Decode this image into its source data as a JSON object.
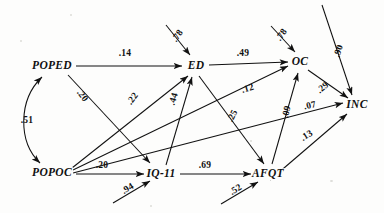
{
  "diagram": {
    "type": "path-analysis-diagram",
    "title": "",
    "nodes": [
      {
        "id": "POPED",
        "label": "POPED",
        "x": 52,
        "y": 66
      },
      {
        "id": "POPOC",
        "label": "POPOC",
        "x": 52,
        "y": 173
      },
      {
        "id": "ED",
        "label": "ED",
        "x": 196,
        "y": 66
      },
      {
        "id": "IQ11",
        "label": "IQ-11",
        "x": 161,
        "y": 174
      },
      {
        "id": "OC",
        "label": "OC",
        "x": 300,
        "y": 62
      },
      {
        "id": "AFQT",
        "label": "AFQT",
        "x": 268,
        "y": 174
      },
      {
        "id": "INC",
        "label": "INC",
        "x": 357,
        "y": 105
      }
    ],
    "edges": [
      {
        "from": "POPED",
        "to": "ED",
        "coef": ".14",
        "lx": 125,
        "ly": 54,
        "rot": 0
      },
      {
        "from": "POPED",
        "to": "IQ11",
        "coef": ".20",
        "lx": 82,
        "ly": 96,
        "rot": 52
      },
      {
        "from": "POPOC",
        "to": "ED",
        "coef": ".22",
        "lx": 133,
        "ly": 99,
        "rot": -52
      },
      {
        "from": "POPOC",
        "to": "OC",
        "coef": ".12",
        "lx": 248,
        "ly": 89,
        "rot": -16
      },
      {
        "from": "POPOC",
        "to": "INC",
        "coef": ".07",
        "lx": 310,
        "ly": 106,
        "rot": -13
      },
      {
        "from": "POPOC",
        "to": "IQ11",
        "coef": ".20",
        "lx": 102,
        "ly": 166,
        "rot": 0
      },
      {
        "from": "IQ11",
        "to": "ED",
        "coef": ".44",
        "lx": 174,
        "ly": 99,
        "rot": -73
      },
      {
        "from": "IQ11",
        "to": "AFQT",
        "coef": ".69",
        "lx": 205,
        "ly": 166,
        "rot": 0
      },
      {
        "from": "ED",
        "to": "OC",
        "coef": ".49",
        "lx": 243,
        "ly": 54,
        "rot": 0
      },
      {
        "from": "ED",
        "to": "AFQT",
        "coef": ".25",
        "lx": 233,
        "ly": 116,
        "rot": -63
      },
      {
        "from": "AFQT",
        "to": "OC",
        "coef": ".09",
        "lx": 287,
        "ly": 112,
        "rot": -78
      },
      {
        "from": "AFQT",
        "to": "INC",
        "coef": ".13",
        "lx": 307,
        "ly": 136,
        "rot": -32
      },
      {
        "from": "OC",
        "to": "INC",
        "coef": ".29",
        "lx": 323,
        "ly": 88,
        "rot": -40
      },
      {
        "from": "POPED",
        "to": "POPOC",
        "coef": ".51",
        "lx": 27,
        "ly": 121,
        "rot": 0,
        "style": "double-headed-curve"
      }
    ],
    "residuals": [
      {
        "to": "ED",
        "coef": ".78",
        "lx": 178,
        "ly": 36,
        "rot": -55
      },
      {
        "to": "OC",
        "coef": ".78",
        "lx": 282,
        "ly": 35,
        "rot": -55
      },
      {
        "to": "INC",
        "coef": ".90",
        "lx": 339,
        "ly": 51,
        "rot": -72
      },
      {
        "to": "IQ11",
        "coef": ".94",
        "lx": 128,
        "ly": 189,
        "rot": -32
      },
      {
        "to": "AFQT",
        "coef": ".52",
        "lx": 236,
        "ly": 190,
        "rot": -32
      }
    ]
  }
}
